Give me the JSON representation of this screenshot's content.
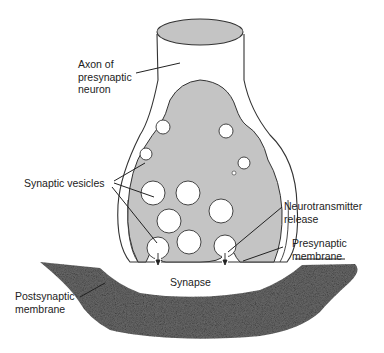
{
  "diagram": {
    "labels": {
      "axon": "Axon of\npresynaptic\nneuron",
      "vesicles": "Synaptic vesicles",
      "neurotransmitter": "Neurotransmitter\nrelease",
      "presynaptic_membrane": "Presynaptic\nmembrane",
      "synapse": "Synapse",
      "postsynaptic_membrane": "Postsynaptic\nmembrane"
    },
    "colors": {
      "cytoplasm": "#c4c4c4",
      "outline": "#333333",
      "postsynaptic": "#6e6e6e",
      "vesicle": "#ffffff"
    }
  }
}
